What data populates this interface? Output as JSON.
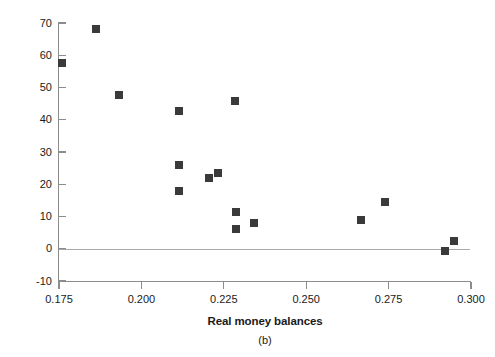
{
  "figure": {
    "panel_caption": "(b)",
    "marker_color": "#3a3a3a",
    "axis_color": "#8c8c8c",
    "zero_line_color": "#a8a8a8"
  },
  "chart_data": {
    "type": "scatter",
    "title": "",
    "subtitle": "",
    "panel": "(b)",
    "xlabel": "Real money balances",
    "ylabel": "Monthly inflation rate (percent)",
    "xlim": [
      0.175,
      0.3
    ],
    "ylim": [
      -10,
      70
    ],
    "xticks": [
      0.175,
      0.2,
      0.225,
      0.25,
      0.275,
      0.3
    ],
    "xtick_labels": [
      "0.175",
      "0.200",
      "0.225",
      "0.250",
      "0.275",
      "0.300"
    ],
    "yticks": [
      -10,
      0,
      10,
      20,
      30,
      40,
      50,
      60,
      70
    ],
    "ytick_labels": [
      "-10",
      "0",
      "10",
      "20",
      "30",
      "40",
      "50",
      "60",
      "70"
    ],
    "grid": false,
    "zero_reference_line": true,
    "legend": null,
    "marker": "square",
    "points": [
      {
        "x": 0.1759,
        "y": 57.5
      },
      {
        "x": 0.1863,
        "y": 68.0
      },
      {
        "x": 0.1933,
        "y": 47.8
      },
      {
        "x": 0.2115,
        "y": 42.7
      },
      {
        "x": 0.2113,
        "y": 26.0
      },
      {
        "x": 0.2113,
        "y": 18.0
      },
      {
        "x": 0.2205,
        "y": 21.8
      },
      {
        "x": 0.2233,
        "y": 23.5
      },
      {
        "x": 0.2285,
        "y": 45.8
      },
      {
        "x": 0.2288,
        "y": 11.5
      },
      {
        "x": 0.2288,
        "y": 6.0
      },
      {
        "x": 0.2343,
        "y": 8.0
      },
      {
        "x": 0.2665,
        "y": 8.8
      },
      {
        "x": 0.274,
        "y": 14.6
      },
      {
        "x": 0.292,
        "y": -0.8
      },
      {
        "x": 0.2948,
        "y": 2.5
      }
    ]
  }
}
